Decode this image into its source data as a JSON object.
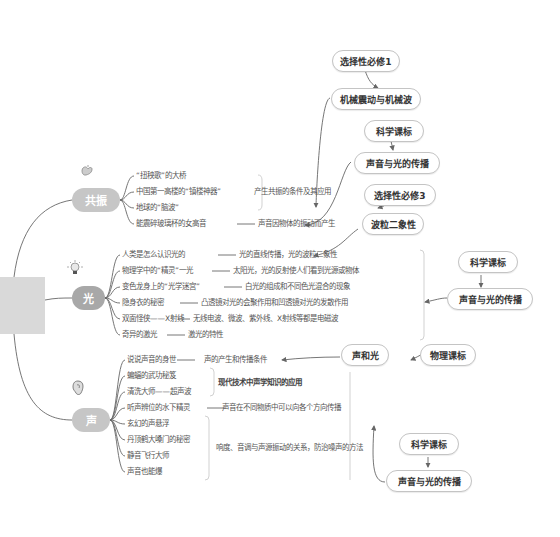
{
  "root": {
    "label": ""
  },
  "topics": [
    {
      "label": "共振",
      "icon": "stomach-icon",
      "leaves": [
        "“扭秧歌”的大桥",
        "中国第一高楼的“镇楼神器”",
        "地球的“脑波”",
        "能震碎玻璃杯的女高音"
      ],
      "summaries": [
        "产生共振的条件及其应用",
        "声音因物体的振动而产生"
      ]
    },
    {
      "label": "光",
      "icon": "lightbulb-icon",
      "leaves": [
        "人类是怎么认识光的",
        "物理学中的“精灵”一光",
        "变色龙身上的“光学迷宫”",
        "隐身衣的秘密",
        "双面怪侠——X射线",
        "奇异的激光"
      ],
      "summaries": [
        "光的直线传播，光的波粒二象性",
        "太阳光，光的反射使人们看到光源或物体",
        "白光的组成和不同色光混合的现象",
        "凸透镜对光的会聚作用和凹透镜对光的发散作用",
        "无线电波、微波、紫外线、X射线等都是电磁波",
        "激光的特性"
      ]
    },
    {
      "label": "声",
      "icon": "ear-icon",
      "leaves": [
        "说说声音的身世",
        "蝙蝠的武功秘笈",
        "清洗大师——超声波",
        "听声辨位的水下精灵",
        "玄幻的声悬浮",
        "丹顶鹤大嗓门的秘密",
        "静音飞行大师",
        "声音也能爆"
      ],
      "summaries": [
        "声的产生和传播条件",
        "现代技术中声学知识的应用",
        "声音在不同物质中可以向各个方向传播",
        "响度、音调与声源振动的关系，防治噪声的方法"
      ]
    }
  ],
  "callouts": {
    "xuanze1": "选择性必修1",
    "jixie": "机械震动与机械波",
    "kexue1": "科学课标",
    "shengyin1": "声音与光的传播",
    "xuanze3": "选择性必修3",
    "boli": "波粒二象性",
    "kexue2": "科学课标",
    "shengyin2": "声音与光的传播",
    "shengheguang": "声和光",
    "wuli": "物理课标",
    "kexue3": "科学课标",
    "shengyin3": "声音与光的传播"
  },
  "colors": {
    "topic": "#c6c6c6",
    "topic_dark": "#a8a8a8",
    "line": "#555555",
    "pill_border": "#c4c4c4"
  }
}
